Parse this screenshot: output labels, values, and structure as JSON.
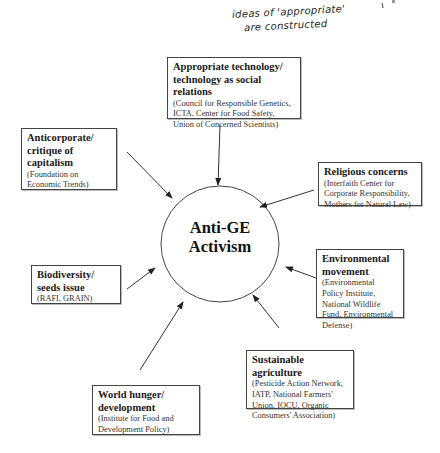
{
  "annotation": {
    "line1": "ideas of 'appropriate'",
    "line2": "are constructed"
  },
  "center": {
    "line1": "Anti-GE",
    "line2": "Activism"
  },
  "nodes": [
    {
      "id": "appropriate-technology",
      "title": "Appropriate technology/ technology as social relations",
      "orgs": "(Council for Responsible Genetics, ICTA, Center for Food Safety, Union of Concerned Scientists)"
    },
    {
      "id": "anticorporate",
      "title": "Anticorporate/ critique of capitalism",
      "orgs": "(Foundation on Economic Trends)"
    },
    {
      "id": "religious-concerns",
      "title": "Religious concerns",
      "orgs": "(Interfaith Center for Corporate Responsibility, Mothers for Natural Law)"
    },
    {
      "id": "environmental-movement",
      "title": "Environmental movement",
      "orgs": "(Environmental Policy Institute, National Wildlife Fund, Environmental Defense)"
    },
    {
      "id": "biodiversity",
      "title": "Biodiversity/ seeds issue",
      "orgs": "(RAFI, GRAIN)"
    },
    {
      "id": "sustainable-agriculture",
      "title": "Sustainable agriculture",
      "orgs": "(Pesticide Action Network, IATP, National Farmers' Union, IOCU, Organic Consumers' Association)"
    },
    {
      "id": "world-hunger",
      "title": "World hunger/ development",
      "orgs": "(Institute for Food and Development Policy)"
    }
  ],
  "colors": {
    "line": "#333333",
    "box_border": "#444444",
    "background": "#ffffff"
  }
}
